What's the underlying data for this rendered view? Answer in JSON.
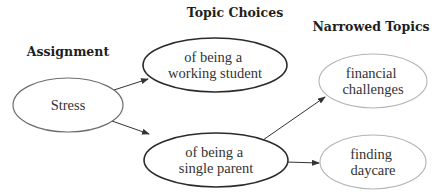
{
  "headings": {
    "assignment": "Assignment",
    "topic_choices": "Topic Choices",
    "narrowed_topics": "Narrowed Topics"
  },
  "nodes": {
    "stress": {
      "lines": [
        "Stress"
      ],
      "level": "assignment"
    },
    "working_student": {
      "lines": [
        "of being a",
        "working student"
      ],
      "level": "topic_choice"
    },
    "single_parent": {
      "lines": [
        "of being a",
        "single parent"
      ],
      "level": "topic_choice"
    },
    "financial_challenges": {
      "lines": [
        "financial",
        "challenges"
      ],
      "level": "narrowed_topic"
    },
    "finding_daycare": {
      "lines": [
        "finding",
        "daycare"
      ],
      "level": "narrowed_topic"
    }
  },
  "edges": [
    {
      "from": "Stress",
      "to": "of being a working student"
    },
    {
      "from": "Stress",
      "to": "of being a single parent"
    },
    {
      "from": "of being a single parent",
      "to": "financial challenges"
    },
    {
      "from": "of being a single parent",
      "to": "finding daycare"
    }
  ],
  "colors": {
    "heading_text": "#1e1e1e",
    "node_text": "#333333",
    "assignment_stroke": "#6e6e6e",
    "topic_choice_stroke": "#2b2b2b",
    "narrowed_topic_stroke": "#b4b4b4",
    "arrow": "#333333",
    "background": "#ffffff"
  }
}
